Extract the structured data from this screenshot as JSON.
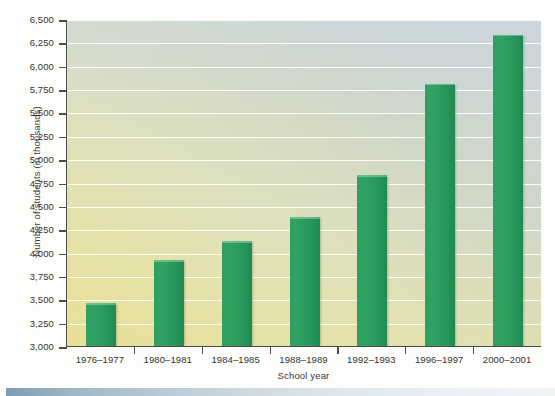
{
  "chart_data": {
    "type": "bar",
    "title": "",
    "xlabel": "School year",
    "ylabel": "Number of students (in thousands)",
    "categories": [
      "1976–1977",
      "1980–1981",
      "1984–1985",
      "1988–1989",
      "1992–1993",
      "1996–1997",
      "2000–2001"
    ],
    "values": [
      3470,
      3930,
      4130,
      4390,
      4840,
      5820,
      6340
    ],
    "ylim": [
      3000,
      6500
    ],
    "ytick_labels": [
      "3,000",
      "3,250",
      "3,500",
      "3,750",
      "4,000",
      "4,250",
      "4,500",
      "4,750",
      "5,000",
      "5,250",
      "5,500",
      "5,750",
      "6,000",
      "6,250",
      "6,500"
    ],
    "ytick_values": [
      3000,
      3250,
      3500,
      3750,
      4000,
      4250,
      4500,
      4750,
      5000,
      5250,
      5500,
      5750,
      6000,
      6250,
      6500
    ],
    "grid": true,
    "legend": null,
    "series_color": "#2b9b5e",
    "plot_bg_gradient": [
      "#e9e09a",
      "#c9d5dc"
    ]
  }
}
